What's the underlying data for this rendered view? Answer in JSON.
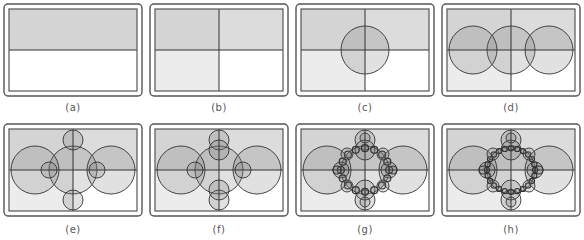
{
  "figure": {
    "panels": [
      {
        "id": "a",
        "label": "(a)",
        "step": 0
      },
      {
        "id": "b",
        "label": "(b)",
        "step": 1
      },
      {
        "id": "c",
        "label": "(c)",
        "step": 2
      },
      {
        "id": "d",
        "label": "(d)",
        "step": 3
      },
      {
        "id": "e",
        "label": "(e)",
        "step": 4
      },
      {
        "id": "f",
        "label": "(f)",
        "step": 5
      },
      {
        "id": "g",
        "label": "(g)",
        "step": 6
      },
      {
        "id": "h",
        "label": "(h)",
        "step": 7
      }
    ],
    "colors": {
      "frame": "#555555",
      "line": "#333333",
      "q_top_left": "#d4d4d4",
      "q_top_right": "#dcdcdc",
      "q_bottom_left": "#ececec",
      "q_bottom_right": "#ffffff",
      "circle_fill": "rgba(120,120,120,0.22)"
    },
    "partial_text_bottom_right": "7.00"
  }
}
